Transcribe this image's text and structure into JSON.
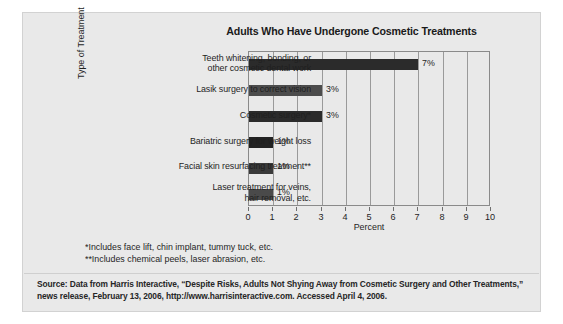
{
  "chart_data": {
    "type": "bar",
    "orientation": "horizontal",
    "title": "Adults Who Have Undergone Cosmetic Treatments",
    "xlabel": "Percent",
    "ylabel": "Type of Treatment",
    "xlim": [
      0,
      10
    ],
    "xticks": [
      0,
      1,
      2,
      3,
      4,
      5,
      6,
      7,
      8,
      9,
      10
    ],
    "xtick_labels": [
      "0",
      "1",
      "2",
      "3",
      "4",
      "5",
      "6",
      "7",
      "8",
      "9",
      "10"
    ],
    "grid": true,
    "legend": null,
    "categories": [
      "Teeth whitening, bonding, or\nother cosmetic dental work",
      "Lasik surgery to correct vision",
      "Cosmetic surgery*",
      "Bariatric surgery for weight loss",
      "Facial skin resurfacing treatment**",
      "Laser treatment for veins,\nhair removal, etc."
    ],
    "values": [
      7,
      3,
      3,
      1,
      1,
      1
    ],
    "value_labels": [
      "7%",
      "3%",
      "3%",
      "1%",
      "1%",
      "1%"
    ],
    "bar_colors": [
      "#2b2b2b",
      "#4c4c4c",
      "#2b2b2b",
      "#232323",
      "#3a3a3a",
      "#4a4a4a"
    ]
  },
  "footnotes": [
    "*Includes face lift, chin implant, tummy tuck, etc.",
    "**Includes chemical peels, laser abrasion, etc."
  ],
  "source": {
    "line1": "Source: Data from Harris Interactive, “Despite Risks, Adults Not Shying Away from Cosmetic Surgery and Other Treatments,”",
    "line2": "news release, February 13, 2006, http://www.harrisinteractive.com. Accessed April 4, 2006."
  },
  "colors": {
    "card_background": "#e9e9e9",
    "page_background": "#ffffff",
    "axis": "#8a8a8a",
    "gridline": "#9a9a9a",
    "text": "#1f1f1f"
  }
}
